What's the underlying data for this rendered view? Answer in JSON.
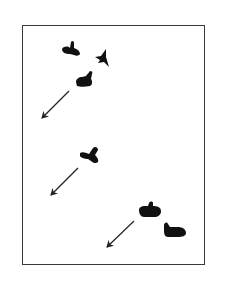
{
  "figure": {
    "frame": {
      "x": 22,
      "y": 25,
      "width": 183,
      "height": 240
    },
    "ink_color": "#111111",
    "frame_color": "#3a3a3a",
    "groups": [
      {
        "name": "group-top",
        "blobs": [
          "blob-bird-left",
          "blob-star",
          "blob-boot"
        ],
        "arrow": {
          "from": [
            69,
            90
          ],
          "to": [
            41,
            118
          ]
        }
      },
      {
        "name": "group-middle",
        "blobs": [
          "blob-cross"
        ],
        "arrow": {
          "from": [
            78,
            168
          ],
          "to": [
            51,
            195
          ]
        }
      },
      {
        "name": "group-bottom",
        "blobs": [
          "blob-hand",
          "blob-foot"
        ],
        "arrow": {
          "from": [
            134,
            220
          ],
          "to": [
            107,
            247
          ]
        }
      }
    ]
  }
}
